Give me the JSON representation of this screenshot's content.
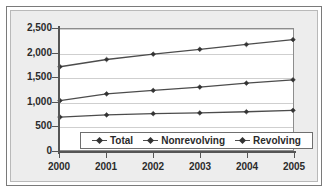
{
  "chart_data": {
    "type": "line",
    "title": "",
    "subtitle": "",
    "xlabel": "",
    "ylabel": "",
    "categories": [
      "2000",
      "2001",
      "2002",
      "2003",
      "2004",
      "2005"
    ],
    "x": [
      2000,
      2001,
      2002,
      2003,
      2004,
      2005
    ],
    "series": [
      {
        "name": "Total",
        "values": [
          1720,
          1870,
          1980,
          2080,
          2180,
          2280
        ],
        "marker": "diamond"
      },
      {
        "name": "Nonrevolving",
        "values": [
          1020,
          1160,
          1230,
          1300,
          1380,
          1450
        ],
        "marker": "diamond"
      },
      {
        "name": "Revolving",
        "values": [
          680,
          725,
          750,
          765,
          790,
          820
        ],
        "marker": "diamond"
      }
    ],
    "ylim": [
      0,
      2500
    ],
    "ytick_values": [
      0,
      500,
      1000,
      1500,
      2000,
      2500
    ],
    "ytick_labels": [
      "0",
      "500",
      "1,000",
      "1,500",
      "2,000",
      "2,500"
    ],
    "xtick_labels": [
      "2000",
      "2001",
      "2002",
      "2003",
      "2004",
      "2005"
    ],
    "grid": true,
    "grid_axis": "y",
    "legend_position": "inside-bottom-center",
    "legend_entries": [
      "Total",
      "Nonrevolving",
      "Revolving"
    ],
    "colors": {
      "series_line": "#4c4c4c",
      "marker": "#333333",
      "gridline": "#cfcfcf",
      "axis": "#555555",
      "plot_background": "#ffffff",
      "figure_background": "#ededed",
      "text": "#2b2b2b"
    }
  }
}
